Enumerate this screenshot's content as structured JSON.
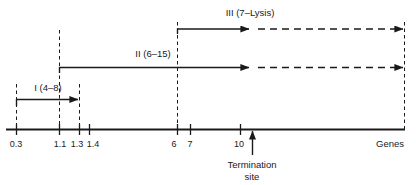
{
  "figure": {
    "colors": {
      "ink": "#1a1a1a",
      "background": "#ffffff"
    }
  },
  "axis": {
    "name": "Genes",
    "ticks": [
      {
        "label": "0.3",
        "x": 16
      },
      {
        "label": "1.1",
        "x": 59
      },
      {
        "label": "1.3",
        "x": 79
      },
      {
        "label": "1.4",
        "x": 89
      },
      {
        "label": "6",
        "x": 177
      },
      {
        "label": "7",
        "x": 190
      },
      {
        "label": "10",
        "x": 240
      }
    ]
  },
  "annotation": {
    "termination_line1": "Termination",
    "termination_line2": "site"
  },
  "units": [
    {
      "id": "unit-1",
      "label": "I (4–8)",
      "start_tick": "0.3",
      "end_tick": "1.3",
      "solid": true,
      "dashed_extension": false
    },
    {
      "id": "unit-2",
      "label": "II (6–15)",
      "start_tick": "1.1",
      "end_tick": "10",
      "solid": true,
      "dashed_extension": true
    },
    {
      "id": "unit-3",
      "label": "III (7–Lysis)",
      "start_tick": "6",
      "end_tick": "10",
      "solid": true,
      "dashed_extension": true
    }
  ]
}
